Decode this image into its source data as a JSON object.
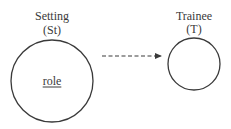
{
  "diagram": {
    "nodes": [
      {
        "id": "setting",
        "title": "Setting",
        "abbrev": "(St)",
        "inner_label": "role",
        "inner_label_underlined": true,
        "shape": "circle"
      },
      {
        "id": "trainee",
        "title": "Trainee",
        "abbrev": "(T)",
        "inner_label": "",
        "shape": "circle"
      }
    ],
    "edges": [
      {
        "from": "setting",
        "to": "trainee",
        "style": "dashed",
        "arrowhead": "end"
      }
    ],
    "colors": {
      "stroke": "#3a3a3a",
      "background": "#ffffff"
    }
  }
}
